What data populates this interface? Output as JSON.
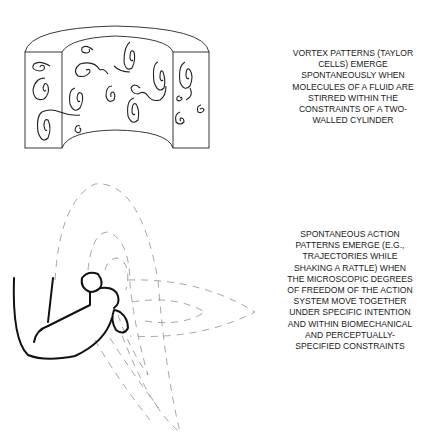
{
  "panels": [
    {
      "id": "taylor-cells",
      "illustration": "two-walled-cylinder-with-vortices",
      "caption": "VORTEX PATTERNS (TAYLOR\nCELLS) EMERGE\nSPONTANEOUSLY WHEN\nMOLECULES OF A FLUID ARE\nSTIRRED WITHIN THE\nCONSTRAINTS OF A TWO-\nWALLED CYLINDER"
    },
    {
      "id": "action-patterns",
      "illustration": "arm-shaking-rattle-with-dashed-trajectories",
      "caption": "SPONTANEOUS ACTION\nPATTERNS EMERGE (E.G.,\nTRAJECTORIES WHILE\nSHAKING A RATTLE) WHEN\nTHE MICROSCOPIC DEGREES\nOF FREEDOM OF THE ACTION\nSYSTEM MOVE TOGETHER\nUNDER SPECIFIC INTENTION\nAND WITHIN BIOMECHANICAL\nAND PERCEPTUALLY-\nSPECIFIED CONSTRAINTS"
    }
  ],
  "colors": {
    "line": "#222222",
    "dashed": "#9a9a9a",
    "text": "#1a1a1a"
  }
}
